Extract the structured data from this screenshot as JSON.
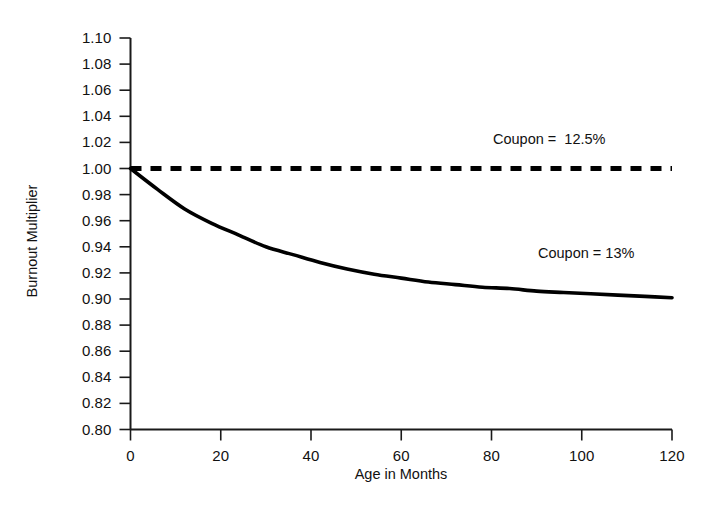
{
  "chart_data": {
    "type": "line",
    "title": "",
    "subtitle": "",
    "xlabel": "Age in Months",
    "ylabel": "Burnout Multiplier",
    "xlim": [
      0,
      120
    ],
    "ylim": [
      0.8,
      1.1
    ],
    "grid": false,
    "legend_position": "inline-annotation",
    "x_ticks": [
      0,
      20,
      40,
      60,
      80,
      100,
      120
    ],
    "x_tick_labels": [
      "0",
      "20",
      "40",
      "60",
      "80",
      "100",
      "120"
    ],
    "y_ticks": [
      0.8,
      0.82,
      0.84,
      0.86,
      0.88,
      0.9,
      0.92,
      0.94,
      0.96,
      0.98,
      1.0,
      1.02,
      1.04,
      1.06,
      1.08,
      1.1
    ],
    "y_tick_labels": [
      "0.80",
      "0.82",
      "0.84",
      "0.86",
      "0.88",
      "0.90",
      "0.92",
      "0.94",
      "0.96",
      "0.98",
      "1.00",
      "1.02",
      "1.04",
      "1.06",
      "1.08",
      "1.10"
    ],
    "x": [
      0,
      6,
      12,
      18,
      24,
      30,
      36,
      42,
      48,
      54,
      60,
      66,
      72,
      78,
      84,
      90,
      96,
      102,
      108,
      114,
      120
    ],
    "series": [
      {
        "name": "Coupon = 12.5%",
        "label": "Coupon =  12.5%",
        "style": "dashed",
        "color": "#000000",
        "values": [
          1.0,
          1.0,
          1.0,
          1.0,
          1.0,
          1.0,
          1.0,
          1.0,
          1.0,
          1.0,
          1.0,
          1.0,
          1.0,
          1.0,
          1.0,
          1.0,
          1.0,
          1.0,
          1.0,
          1.0,
          1.0
        ]
      },
      {
        "name": "Coupon = 13%",
        "label": "Coupon = 13%",
        "style": "solid",
        "color": "#000000",
        "values": [
          1.0,
          0.984,
          0.969,
          0.958,
          0.949,
          0.94,
          0.934,
          0.928,
          0.923,
          0.919,
          0.916,
          0.913,
          0.911,
          0.909,
          0.908,
          0.906,
          0.905,
          0.904,
          0.903,
          0.902,
          0.901
        ]
      }
    ]
  }
}
